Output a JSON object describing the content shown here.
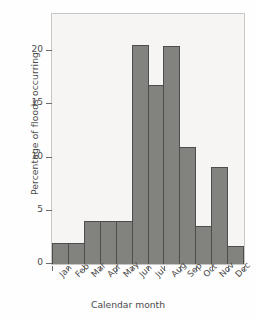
{
  "chart_data": {
    "type": "bar",
    "title": "",
    "xlabel": "Calendar month",
    "ylabel": "Percentage of floods occurring",
    "categories": [
      "Jan",
      "Feb",
      "Mar",
      "Apr",
      "May",
      "Jun",
      "Jul",
      "Aug",
      "Sep",
      "Oct",
      "Nov",
      "Dec"
    ],
    "values": [
      2.0,
      2.0,
      4.0,
      4.0,
      4.0,
      20.6,
      16.8,
      20.5,
      11.0,
      3.6,
      9.1,
      1.7
    ],
    "ylim": [
      0,
      23.5
    ],
    "xlim_categories": 12,
    "yticks": [
      0,
      5,
      10,
      15,
      20
    ],
    "ytick_labels": [
      "0",
      "5",
      "10",
      "15",
      "20"
    ],
    "grid": false,
    "legend": null,
    "bar_color": "#82827f",
    "bar_edge_color": "#4d4d4b",
    "plot_background": "#f6f5f3",
    "axis_color": "#6e6c6a",
    "text_color": "#4a4a4a"
  }
}
